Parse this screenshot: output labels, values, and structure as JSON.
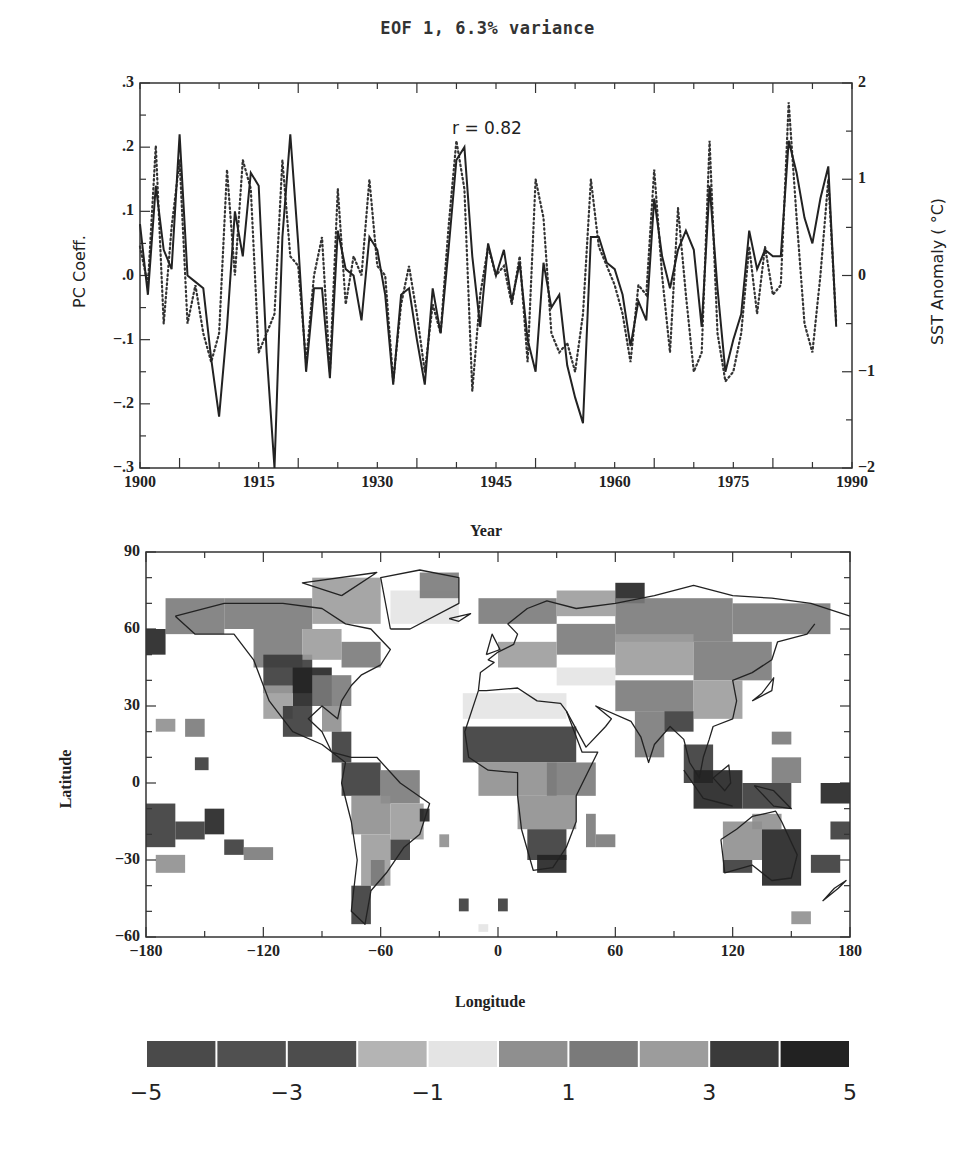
{
  "chart_data": [
    {
      "type": "line",
      "title": "EOF 1,  6.3% variance",
      "annotation": "r = 0.82",
      "xlabel": "Year",
      "ylabel_left": "PC Coeff.",
      "ylabel_right": "SST Anomaly ( °C)",
      "xlim": [
        1900,
        1990
      ],
      "ylim_left": [
        -0.3,
        0.3
      ],
      "ylim_right": [
        -2,
        2
      ],
      "x_ticks": [
        "1900",
        "1915",
        "1930",
        "1945",
        "1960",
        "1975",
        "1990"
      ],
      "y_ticks_left": [
        ".3",
        ".2",
        ".1",
        ".0",
        "-.1",
        "-.2",
        "-.3"
      ],
      "y_ticks_right": [
        "2",
        "1",
        "0",
        "-1",
        "-2"
      ],
      "grid": false,
      "series": [
        {
          "name": "PC coefficient (solid)",
          "style": "solid",
          "axis": "left",
          "x": [
            1900,
            1901,
            1902,
            1903,
            1904,
            1905,
            1906,
            1907,
            1908,
            1909,
            1910,
            1911,
            1912,
            1913,
            1914,
            1915,
            1916,
            1917,
            1918,
            1919,
            1920,
            1921,
            1922,
            1923,
            1924,
            1925,
            1926,
            1927,
            1928,
            1929,
            1930,
            1931,
            1932,
            1933,
            1934,
            1935,
            1936,
            1937,
            1938,
            1939,
            1940,
            1941,
            1942,
            1943,
            1944,
            1945,
            1946,
            1947,
            1948,
            1949,
            1950,
            1951,
            1952,
            1953,
            1954,
            1955,
            1956,
            1957,
            1958,
            1959,
            1960,
            1961,
            1962,
            1963,
            1964,
            1965,
            1966,
            1967,
            1968,
            1969,
            1970,
            1971,
            1972,
            1973,
            1974,
            1975,
            1976,
            1977,
            1978,
            1979,
            1980,
            1981,
            1982,
            1983,
            1984,
            1985,
            1986,
            1987,
            1988
          ],
          "values": [
            0.08,
            -0.03,
            0.14,
            0.04,
            0.01,
            0.22,
            0.0,
            -0.01,
            -0.02,
            -0.13,
            -0.22,
            -0.08,
            0.1,
            0.03,
            0.16,
            0.14,
            -0.12,
            -0.3,
            0.06,
            0.22,
            0.05,
            -0.15,
            -0.02,
            -0.02,
            -0.16,
            0.07,
            0.01,
            0.0,
            -0.07,
            0.06,
            0.04,
            -0.03,
            -0.17,
            -0.03,
            -0.02,
            -0.1,
            -0.17,
            -0.02,
            -0.09,
            0.04,
            0.18,
            0.2,
            0.03,
            -0.08,
            0.05,
            0.0,
            0.04,
            -0.04,
            0.02,
            -0.1,
            -0.15,
            0.02,
            -0.05,
            -0.03,
            -0.14,
            -0.19,
            -0.23,
            0.06,
            0.06,
            0.02,
            0.01,
            -0.03,
            -0.11,
            -0.04,
            -0.07,
            0.12,
            0.03,
            -0.02,
            0.04,
            0.07,
            0.04,
            -0.08,
            0.14,
            -0.02,
            -0.15,
            -0.1,
            -0.06,
            0.07,
            0.01,
            0.04,
            0.03,
            0.03,
            0.21,
            0.16,
            0.09,
            0.05,
            0.12,
            0.17,
            -0.08
          ]
        },
        {
          "name": "SST anomaly (dotted)",
          "style": "dotted",
          "axis": "right",
          "x": [
            1900,
            1901,
            1902,
            1903,
            1904,
            1905,
            1906,
            1907,
            1908,
            1909,
            1910,
            1911,
            1912,
            1913,
            1914,
            1915,
            1916,
            1917,
            1918,
            1919,
            1920,
            1921,
            1922,
            1923,
            1924,
            1925,
            1926,
            1927,
            1928,
            1929,
            1930,
            1931,
            1932,
            1933,
            1934,
            1935,
            1936,
            1937,
            1938,
            1939,
            1940,
            1941,
            1942,
            1943,
            1944,
            1945,
            1946,
            1947,
            1948,
            1949,
            1950,
            1951,
            1952,
            1953,
            1954,
            1955,
            1956,
            1957,
            1958,
            1959,
            1960,
            1961,
            1962,
            1963,
            1964,
            1965,
            1966,
            1967,
            1968,
            1969,
            1970,
            1971,
            1972,
            1973,
            1974,
            1975,
            1976,
            1977,
            1978,
            1979,
            1980,
            1981,
            1982,
            1983,
            1984,
            1985,
            1986,
            1987,
            1988
          ],
          "values": [
            0.3,
            -0.1,
            1.35,
            -0.5,
            0.5,
            1.2,
            -0.5,
            -0.1,
            -0.6,
            -0.9,
            -0.6,
            1.1,
            0.0,
            1.2,
            0.9,
            -0.8,
            -0.6,
            -0.4,
            1.2,
            0.2,
            0.1,
            -0.9,
            0.0,
            0.4,
            -1.0,
            0.9,
            -0.3,
            0.2,
            0.0,
            1.0,
            0.1,
            0.0,
            -1.1,
            -0.3,
            0.1,
            -0.4,
            -1.0,
            -0.3,
            -0.6,
            0.5,
            1.4,
            0.9,
            -1.2,
            -0.2,
            0.3,
            0.0,
            0.1,
            -0.3,
            0.2,
            -0.9,
            1.0,
            0.6,
            -0.6,
            -0.8,
            -0.7,
            -1.0,
            -0.4,
            1.0,
            0.3,
            0.1,
            -0.1,
            -0.4,
            -0.9,
            -0.1,
            -0.2,
            1.1,
            0.0,
            -0.8,
            0.7,
            -0.2,
            -1.0,
            -0.8,
            1.4,
            -0.6,
            -1.1,
            -1.0,
            -0.6,
            0.3,
            -0.4,
            0.3,
            -0.2,
            -0.1,
            1.8,
            0.6,
            -0.5,
            -0.8,
            0.0,
            1.0,
            -0.5
          ]
        }
      ]
    },
    {
      "type": "heatmap",
      "title": "",
      "xlabel": "Longitude",
      "ylabel": "Latitude",
      "xlim": [
        -180,
        180
      ],
      "ylim": [
        -60,
        90
      ],
      "x_ticks": [
        "-180",
        "-120",
        "-60",
        "0",
        "60",
        "120",
        "180"
      ],
      "y_ticks": [
        "90",
        "60",
        "30",
        "0",
        "-30",
        "-60"
      ],
      "colorbar": {
        "ticks": [
          "-5",
          "-3",
          "-1",
          "1",
          "3",
          "5"
        ],
        "bins": [
          -5,
          -4,
          -3,
          -2,
          -1,
          0,
          1,
          2,
          3,
          4,
          5
        ],
        "colors": [
          "#4a4a4a",
          "#505050",
          "#4d4d4d",
          "#b4b4b4",
          "#e4e4e4",
          "#8f8f8f",
          "#7a7a7a",
          "#9c9c9c",
          "#3a3a3a",
          "#222222"
        ]
      },
      "description": "Global gridded correlation/loading map with coastlines; strongest positive values over central North America, Northern Africa Sahel, Maritime Continent and eastern Australia; broad moderate values over Eurasia."
    }
  ],
  "page": {
    "title": "EOF 1,  6.3% variance",
    "annotation": "r = 0.82",
    "ts_xlabel": "Year",
    "ts_ylabel_left": "PC Coeff.",
    "ts_ylabel_right": "SST Anomaly ( °C)",
    "map_xlabel": "Longitude",
    "map_ylabel": "Latitude"
  }
}
